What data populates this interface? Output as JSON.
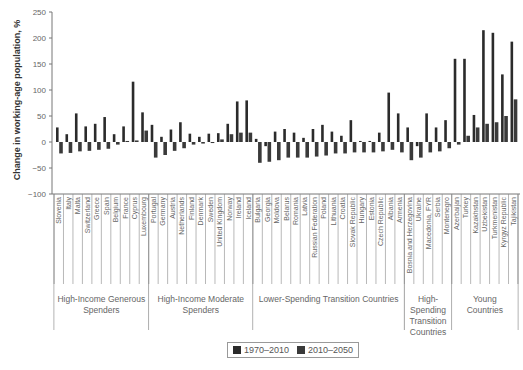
{
  "chart_data": {
    "type": "bar",
    "title": "",
    "xlabel": "",
    "ylabel": "Change in working-age population, %",
    "ylim": [
      -100,
      250
    ],
    "yticks": [
      250,
      200,
      150,
      100,
      50,
      0,
      -50,
      -100
    ],
    "grid": false,
    "legend_position": "bottom",
    "categories": [
      "Slovenia",
      "Italy",
      "Malta",
      "Switzerland",
      "Greece",
      "Spain",
      "Belgium",
      "France",
      "Cyprus",
      "Luxembourg",
      "Portugal",
      "Germany",
      "Austria",
      "Netherlands",
      "Finland",
      "Denmark",
      "Sweden",
      "United Kingdom",
      "Norway",
      "Ireland",
      "Iceland",
      "Bulgaria",
      "Georgia",
      "Moldova",
      "Belarus",
      "Romania",
      "Latvia",
      "Russian Federation",
      "Poland",
      "Lithuania",
      "Croatia",
      "Slovak Republic",
      "Hungary",
      "Estonia",
      "Czech Republic",
      "Albania",
      "Armenia",
      "Bosnia and Herzegovina",
      "Ukraine",
      "Macedonia, FYR",
      "Serbia",
      "Montenegro",
      "Azerbaijan",
      "Turkey",
      "Kazakhstan",
      "Uzbekistan",
      "Turkmenistan",
      "Kyrgyz Republic",
      "Tajikistan"
    ],
    "series": [
      {
        "name": "1970–2010",
        "color": "#2b2b2b",
        "values": [
          28,
          15,
          55,
          30,
          35,
          48,
          15,
          30,
          116,
          57,
          33,
          10,
          24,
          38,
          16,
          10,
          16,
          17,
          35,
          78,
          80,
          6,
          -8,
          20,
          25,
          18,
          8,
          25,
          33,
          20,
          12,
          42,
          2,
          2,
          18,
          95,
          55,
          28,
          -8,
          55,
          28,
          42,
          160,
          160,
          52,
          215,
          210,
          130,
          193
        ]
      },
      {
        "name": "2010–2050",
        "color": "#3a3a3a",
        "values": [
          -22,
          -21,
          -18,
          -17,
          -15,
          -13,
          -5,
          2,
          3,
          22,
          -30,
          -25,
          -17,
          -12,
          -5,
          -3,
          -2,
          5,
          15,
          18,
          18,
          -40,
          -38,
          -35,
          -30,
          -30,
          -30,
          -28,
          -26,
          -22,
          -22,
          -20,
          -20,
          -20,
          -18,
          -15,
          -20,
          -35,
          -30,
          -20,
          -18,
          -12,
          -5,
          12,
          28,
          35,
          38,
          50,
          82
        ]
      }
    ],
    "groups": [
      {
        "label": "High-Income Generous Spenders",
        "start": 0,
        "end": 9
      },
      {
        "label": "High-Income Moderate Spenders",
        "start": 10,
        "end": 20
      },
      {
        "label": "Lower-Spending Transition Countries",
        "start": 21,
        "end": 36
      },
      {
        "label": "High-Spending Transition Countries",
        "start": 37,
        "end": 41
      },
      {
        "label": "Young Countries",
        "start": 42,
        "end": 48
      }
    ]
  },
  "legend": {
    "items": [
      {
        "label": "1970–2010",
        "color": "#2b2b2b"
      },
      {
        "label": "2010–2050",
        "color": "#3a3a3a"
      }
    ]
  }
}
